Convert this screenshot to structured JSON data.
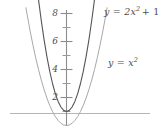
{
  "figure": {
    "title": "",
    "background_color": "#ffffff",
    "width": 163,
    "height": 137
  },
  "axes": {
    "y_axis": {
      "name": "y-axis",
      "color": "#808080",
      "x_pixel": 66,
      "top_pixel": 10,
      "bottom_pixel": 125,
      "major_tick_labels": [
        "8",
        "6",
        "4",
        "2"
      ],
      "major_tick_values": [
        8,
        6,
        4,
        2
      ],
      "minor_tick_values": [
        7,
        5,
        3,
        1
      ],
      "tick_color": "#808080"
    },
    "x_axis": {
      "name": "x-axis",
      "color": "#b3b3b3",
      "y_pixel": 113,
      "left_pixel": 10,
      "right_pixel": 150,
      "tick_labels": []
    }
  },
  "chart_data": {
    "type": "line",
    "title": "",
    "xlabel": "",
    "ylabel": "",
    "xlim": [
      -2.6,
      2.6
    ],
    "ylim": [
      -1.0,
      8.6
    ],
    "grid": false,
    "legend": "inline-curve-labels",
    "series": [
      {
        "name": "y = 2x^2 + 1",
        "label_text": "y = 2x",
        "label_exponent": "2",
        "label_suffix": "+ 1",
        "expression": "y = 2x² + 1",
        "color": "#555555",
        "linewidth": 1.1,
        "vertex": [
          0,
          1
        ],
        "x": [
          -2.0,
          -1.8,
          -1.6,
          -1.4,
          -1.2,
          -1.0,
          -0.8,
          -0.6,
          -0.4,
          -0.2,
          0.0,
          0.2,
          0.4,
          0.6,
          0.8,
          1.0,
          1.2,
          1.4,
          1.6,
          1.8,
          2.0
        ],
        "y": [
          9.0,
          7.48,
          6.12,
          4.92,
          3.88,
          3.0,
          2.28,
          1.72,
          1.32,
          1.08,
          1.0,
          1.08,
          1.32,
          1.72,
          2.28,
          3.0,
          3.88,
          4.92,
          6.12,
          7.48,
          9.0
        ]
      },
      {
        "name": "y = x^2",
        "label_text": "y = x",
        "label_exponent": "2",
        "label_suffix": "",
        "expression": "y = x²",
        "color": "#a8a8a8",
        "linewidth": 1.0,
        "vertex": [
          0,
          0
        ],
        "x": [
          -2.9,
          -2.6,
          -2.4,
          -2.2,
          -2.0,
          -1.8,
          -1.6,
          -1.4,
          -1.2,
          -1.0,
          -0.8,
          -0.6,
          -0.4,
          -0.2,
          0.0,
          0.2,
          0.4,
          0.6,
          0.8,
          1.0,
          1.2,
          1.4,
          1.6,
          1.8,
          2.0,
          2.2,
          2.4,
          2.6,
          2.9
        ],
        "y": [
          8.41,
          6.76,
          5.76,
          4.84,
          4.0,
          3.24,
          2.56,
          1.96,
          1.44,
          1.0,
          0.64,
          0.36,
          0.16,
          0.04,
          0.0,
          0.04,
          0.16,
          0.36,
          0.64,
          1.0,
          1.44,
          1.96,
          2.56,
          3.24,
          4.0,
          4.84,
          5.76,
          6.76,
          8.41
        ]
      }
    ],
    "annotations": [
      {
        "text": "y = 2x² + 1",
        "x_pixel": 104,
        "y_pixel": 9
      },
      {
        "text": "y = x²",
        "x_pixel": 108,
        "y_pixel": 60
      }
    ]
  }
}
